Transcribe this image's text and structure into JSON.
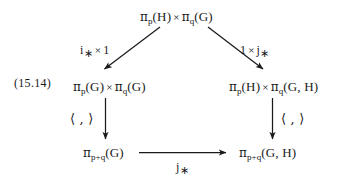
{
  "diagram": {
    "equation_number": "(15.14)",
    "nodes": {
      "top": {
        "id": "top-node",
        "full_text": "π_p(H) × π_q(G)",
        "left": {
          "pi": "π",
          "sub": "p",
          "arg": "(H)"
        },
        "times": "×",
        "right": {
          "pi": "π",
          "sub": "q",
          "arg": "(G)"
        }
      },
      "mid_left": {
        "id": "mid-left-node",
        "full_text": "π_p(G) × π_q(G)",
        "left": {
          "pi": "π",
          "sub": "p",
          "arg": "(G)"
        },
        "times": "×",
        "right": {
          "pi": "π",
          "sub": "q",
          "arg": "(G)"
        }
      },
      "mid_right": {
        "id": "mid-right-node",
        "full_text": "π_p(H) × π_q(G, H)",
        "left": {
          "pi": "π",
          "sub": "p",
          "arg": "(H)"
        },
        "times": "×",
        "right": {
          "pi": "π",
          "sub": "q",
          "arg": "(G, H)"
        }
      },
      "bottom_left": {
        "id": "bottom-left-node",
        "full_text": "π_{p+q}(G)",
        "pi": "π",
        "sub": "p+q",
        "arg": "(G)"
      },
      "bottom_right": {
        "id": "bottom-right-node",
        "full_text": "π_{p+q}(G, H)",
        "pi": "π",
        "sub": "p+q",
        "arg": "(G, H)"
      }
    },
    "edges": [
      {
        "id": "edge-top-to-mid-left",
        "from": "top",
        "to": "mid_left",
        "direction": "diagonal-down-left",
        "label_text": "i_* × 1",
        "label_parts": {
          "map": "i",
          "star": "∗",
          "times": "×",
          "operand": "1"
        }
      },
      {
        "id": "edge-top-to-mid-right",
        "from": "top",
        "to": "mid_right",
        "direction": "diagonal-down-right",
        "label_text": "1 × j_*",
        "label_parts": {
          "operand": "1",
          "times": "×",
          "map": "j",
          "star": "∗"
        }
      },
      {
        "id": "edge-mid-left-to-bottom-left",
        "from": "mid_left",
        "to": "bottom_left",
        "direction": "vertical-down",
        "label_text": "⟨ , ⟩"
      },
      {
        "id": "edge-mid-right-to-bottom-right",
        "from": "mid_right",
        "to": "bottom_right",
        "direction": "vertical-down",
        "label_text": "⟨ , ⟩"
      },
      {
        "id": "edge-bottom-left-to-bottom-right",
        "from": "bottom_left",
        "to": "bottom_right",
        "direction": "horizontal-right",
        "label_text": "j_*",
        "label_parts": {
          "map": "j",
          "star": "∗"
        }
      }
    ],
    "colors": {
      "ink": "#1a1a1a",
      "background": "#ffffff"
    }
  }
}
